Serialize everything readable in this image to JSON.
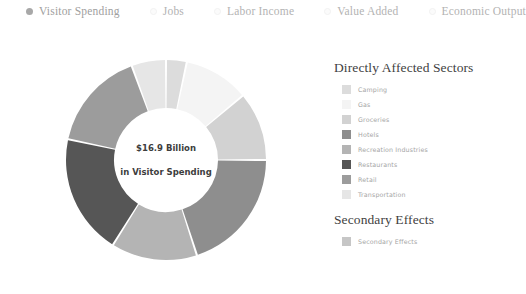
{
  "metric_bar": {
    "options": [
      {
        "label": "Visitor Spending",
        "selected": true
      },
      {
        "label": "Jobs",
        "selected": false
      },
      {
        "label": "Labor Income",
        "selected": false
      },
      {
        "label": "Value Added",
        "selected": false
      },
      {
        "label": "Economic Output",
        "selected": false
      }
    ]
  },
  "center": {
    "amount": "$16.9 Billion",
    "caption": "in Visitor Spending"
  },
  "legend": {
    "primary_title": "Directly Affected Sectors",
    "secondary_title": "Secondary Effects",
    "primary_items": [
      {
        "label": "Camping",
        "color": "#dcdcdc"
      },
      {
        "label": "Gas",
        "color": "#f4f4f4"
      },
      {
        "label": "Groceries",
        "color": "#d2d2d2"
      },
      {
        "label": "Hotels",
        "color": "#8e8e8e"
      },
      {
        "label": "Recreation Industries",
        "color": "#b4b4b4"
      },
      {
        "label": "Restaurants",
        "color": "#565656"
      },
      {
        "label": "Retail",
        "color": "#9c9c9c"
      },
      {
        "label": "Transportation",
        "color": "#e6e6e6"
      }
    ],
    "secondary_items": [
      {
        "label": "Secondary Effects",
        "color": "#c6c6c6"
      }
    ]
  },
  "chart_data": {
    "type": "pie",
    "title": "$16.9 Billion in Visitor Spending",
    "subtitle": "Directly Affected Sectors",
    "units": "billions of USD",
    "total": 16.9,
    "donut": true,
    "inner_radius_ratio": 0.52,
    "start_angle_deg": 0,
    "direction": "clockwise",
    "legend_position": "right",
    "grid": false,
    "categories": [
      "Camping",
      "Gas",
      "Groceries",
      "Hotels",
      "Recreation Industries",
      "Restaurants",
      "Retail",
      "Transportation"
    ],
    "values": [
      0.56,
      1.78,
      1.88,
      3.38,
      2.35,
      3.29,
      2.72,
      0.94
    ],
    "percentages": [
      3.3,
      10.5,
      11.1,
      20.0,
      13.9,
      19.5,
      16.1,
      5.6
    ],
    "angles_deg": [
      12,
      38,
      40,
      72,
      50,
      70,
      58,
      20
    ],
    "colors": [
      "#dcdcdc",
      "#f4f4f4",
      "#d2d2d2",
      "#8e8e8e",
      "#b4b4b4",
      "#565656",
      "#9c9c9c",
      "#e6e6e6"
    ]
  }
}
